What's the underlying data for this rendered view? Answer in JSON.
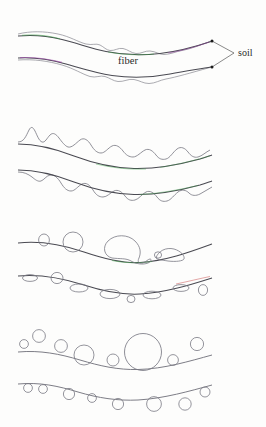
{
  "figure": {
    "background_color": "#fdfdfc",
    "labels": {
      "fiber": "fiber",
      "soil": "soil"
    },
    "stroke_colors": {
      "outline": "#4a4a52",
      "envelope": "#6e6e78",
      "bubble": "#7a7a84",
      "leader": "#3a3a3a",
      "marker": "#1b1b1b",
      "accent_green": "#3fa14a",
      "accent_purple": "#9b3fa8",
      "accent_red": "#c23b3b"
    },
    "panels": [
      {
        "id": "panel-1",
        "name": "smooth-interface",
        "description": "Two gently descending smooth fiber boundaries with faint rippled envelopes and colored accent segments; labelled fiber between them and soil at right.",
        "y_top": 20,
        "y_bottom": 100
      },
      {
        "id": "panel-2",
        "name": "rippled-interface",
        "description": "Two descending boundaries with pronounced sinusoidal ripple envelopes developing along the surface.",
        "y_top": 110,
        "y_bottom": 205
      },
      {
        "id": "panel-3",
        "name": "droplet-interface",
        "description": "Two boundaries with coalesced droplets and lobed blobs sitting on and beneath the surface.",
        "y_top": 212,
        "y_bottom": 308
      },
      {
        "id": "panel-4",
        "name": "bead-interface",
        "description": "Two boundaries decorated with discrete circular beads of varying radii above and below the curve.",
        "y_top": 315,
        "y_bottom": 420
      }
    ],
    "annotations": {
      "soil_leader_endpoints": [
        {
          "name": "upper-curve-endpoint",
          "x": 212,
          "y": 41
        },
        {
          "name": "lower-curve-endpoint",
          "x": 212,
          "y": 67
        }
      ],
      "soil_leader_vertex": {
        "x": 234,
        "y": 53
      },
      "fiber_label_position": {
        "x": 128,
        "y": 61
      },
      "soil_label_position": {
        "x": 238,
        "y": 53
      }
    }
  }
}
